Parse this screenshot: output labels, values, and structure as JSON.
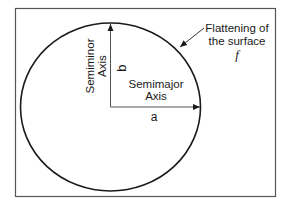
{
  "diagram": {
    "type": "ellipse-geometry",
    "labels": {
      "semiminor_axis": [
        "Semiminor",
        "Axis"
      ],
      "semimajor_axis": [
        "Semimajor",
        "Axis"
      ],
      "b": "b",
      "a": "a",
      "flattening": [
        "Flattening of",
        "the surface"
      ],
      "f": "f"
    },
    "colors": {
      "stroke": "#1a1a1a",
      "frame": "#555555",
      "background": "#ffffff"
    }
  }
}
